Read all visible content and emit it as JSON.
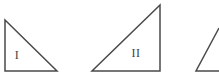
{
  "figure": {
    "width": 219,
    "height": 78,
    "background_color": "#ffffff",
    "stroke_color": "#4a4a4a",
    "label_color": "#3f3f3f",
    "stroke_width": 1.5,
    "caption": "",
    "shapes": [
      {
        "id": "triangle-1",
        "name": "triangle-one",
        "label": "I",
        "label_x": 17,
        "label_y": 55,
        "right_angle_corner": "bottom-left",
        "clipped": false,
        "points": "5,20 5,71 57,71 5,71",
        "outline": "5,20 5,71 57,71"
      },
      {
        "id": "triangle-2",
        "name": "triangle-two",
        "label": "II",
        "label_x": 136,
        "label_y": 53,
        "right_angle_corner": "bottom-right",
        "clipped": false,
        "points": "92,71 160,71 160,5",
        "outline": "92,71 160,71 160,5"
      },
      {
        "id": "triangle-3",
        "name": "triangle-three-clipped",
        "label": "",
        "label_x": 0,
        "label_y": 0,
        "right_angle_corner": "bottom-right",
        "clipped": true,
        "points": "196,71 219,71 219,28",
        "outline": "219,28 196,71 219,71"
      }
    ]
  }
}
